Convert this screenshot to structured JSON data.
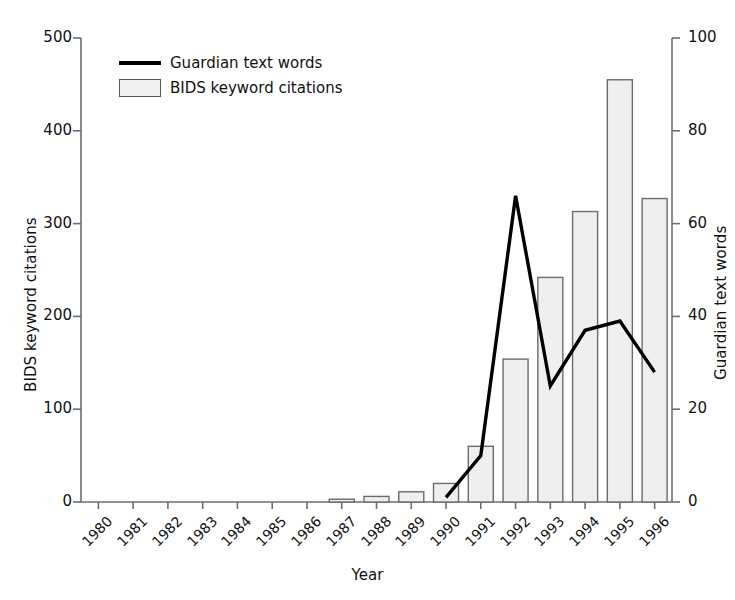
{
  "chart_data": {
    "type": "bar",
    "title": "",
    "xlabel": "Year",
    "ylabel": "BIDS keyword citations",
    "ylabel_right": "Guardian text words",
    "grid": false,
    "legend_position": "upper left",
    "categories": [
      "1980",
      "1981",
      "1982",
      "1983",
      "1984",
      "1985",
      "1986",
      "1987",
      "1988",
      "1989",
      "1990",
      "1991",
      "1992",
      "1993",
      "1994",
      "1995",
      "1996"
    ],
    "ylim": [
      0,
      500
    ],
    "yticks": [
      0,
      100,
      200,
      300,
      400,
      500
    ],
    "ylim_right": [
      0,
      100
    ],
    "yticks_right": [
      0,
      20,
      40,
      60,
      80,
      100
    ],
    "series": [
      {
        "name": "BIDS keyword citations",
        "kind": "bar",
        "axis": "left",
        "color": "#efefef",
        "edge_color": "#6b6b6b",
        "values": [
          0,
          0,
          0,
          0,
          0,
          0,
          0,
          3,
          6,
          11,
          20,
          60,
          154,
          242,
          313,
          455,
          327
        ]
      },
      {
        "name": "Guardian text words",
        "kind": "line",
        "axis": "right",
        "color": "#000000",
        "x": [
          "1990",
          "1991",
          "1992",
          "1993",
          "1994",
          "1995",
          "1996"
        ],
        "values": [
          1,
          10,
          66,
          25,
          37,
          39,
          28
        ]
      }
    ]
  },
  "legend": {
    "line_label": "Guardian text words",
    "box_label": "BIDS keyword citations"
  },
  "axes": {
    "left_title": "BIDS keyword citations",
    "right_title": "Guardian text words",
    "x_title": "Year",
    "left_ticks": [
      "0",
      "100",
      "200",
      "300",
      "400",
      "500"
    ],
    "right_ticks": [
      "0",
      "20",
      "40",
      "60",
      "80",
      "100"
    ]
  }
}
